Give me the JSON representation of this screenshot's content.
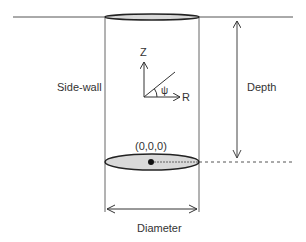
{
  "diagram": {
    "labels": {
      "side_wall": "Side-wall",
      "depth": "Depth",
      "diameter": "Diameter",
      "origin": "(0,0,0)",
      "axis_z": "Z",
      "axis_r": "R",
      "angle": "ψ"
    },
    "colors": {
      "stroke": "#222222",
      "wall": "#555555",
      "ellipse_fill": "#d9d9d9",
      "text": "#333333"
    }
  }
}
